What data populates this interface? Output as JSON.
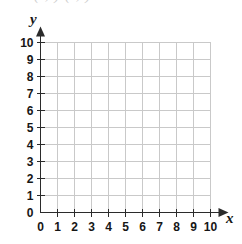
{
  "cropped_header": {
    "text": "( , ) ( , )"
  },
  "chart_data": {
    "type": "scatter",
    "title": "",
    "subtitle": "",
    "xlabel": "x",
    "ylabel": "y",
    "xlim": [
      0,
      10
    ],
    "ylim": [
      0,
      10
    ],
    "x_ticks": [
      0,
      1,
      2,
      3,
      4,
      5,
      6,
      7,
      8,
      9,
      10
    ],
    "y_ticks": [
      0,
      1,
      2,
      3,
      4,
      5,
      6,
      7,
      8,
      9,
      10
    ],
    "x_tick_labels": [
      "0",
      "1",
      "2",
      "3",
      "4",
      "5",
      "6",
      "7",
      "8",
      "9",
      "10"
    ],
    "y_tick_labels": [
      "0",
      "1",
      "2",
      "3",
      "4",
      "5",
      "6",
      "7",
      "8",
      "9",
      "10"
    ],
    "grid": true,
    "grid_step": 1,
    "legend": null,
    "legend_position": "none",
    "annotations": [],
    "series": [],
    "x": [],
    "values": [],
    "axis_arrows": {
      "x": "right",
      "y": "up"
    },
    "colors": {
      "grid": "#c9c9c9",
      "axis": "#2b2b2b",
      "tick_label": "#161616",
      "axis_label": "#161616",
      "background": "#ffffff"
    }
  }
}
